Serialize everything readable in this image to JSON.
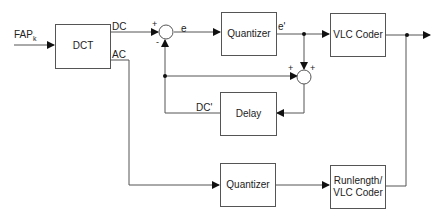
{
  "diagram": {
    "type": "block-diagram",
    "input_label": "FAP",
    "input_subscript": "k",
    "blocks": {
      "dct": "DCT",
      "quantizer_dc": "Quantizer",
      "vlc_coder": "VLC Coder",
      "delay": "Delay",
      "quantizer_ac": "Quantizer",
      "runlength_line1": "Runlength/",
      "runlength_line2": "VLC Coder"
    },
    "signals": {
      "dc": "DC",
      "ac": "AC",
      "error": "e",
      "quantized_error": "e'",
      "reconstructed_dc": "DC'"
    },
    "summing_nodes": {
      "subtractor": {
        "top_left_sign": "+",
        "bottom_sign": "-"
      },
      "adder": {
        "left_sign": "+",
        "top_sign": "+"
      }
    },
    "colors": {
      "line": "#555555",
      "text": "#222222",
      "background": "#ffffff"
    }
  }
}
